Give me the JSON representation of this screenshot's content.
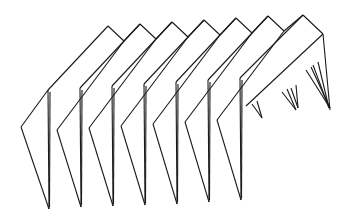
{
  "figure": {
    "stroke_color": "#1a1a1a",
    "background_color": "#ffffff",
    "pleat_count": 7,
    "left_vertex": [
      21,
      127
    ],
    "front_fold_tops": [
      [
        48,
        90
      ],
      [
        80,
        88
      ],
      [
        112,
        86
      ],
      [
        144,
        84
      ],
      [
        176,
        82
      ],
      [
        208,
        80
      ],
      [
        240,
        78
      ]
    ],
    "top_peaks": [
      [
        108,
        26
      ],
      [
        140,
        24
      ],
      [
        172,
        22
      ],
      [
        204,
        20
      ],
      [
        236,
        18
      ],
      [
        268,
        16
      ],
      [
        303,
        15
      ]
    ],
    "top_valleys": [
      [
        124,
        41
      ],
      [
        156,
        39
      ],
      [
        188,
        37
      ],
      [
        220,
        35
      ],
      [
        252,
        33
      ],
      [
        284,
        31
      ]
    ],
    "right_vertex": [
      323,
      34
    ],
    "bottom_tips": [
      [
        49,
        209
      ],
      [
        81,
        207
      ],
      [
        113,
        206
      ],
      [
        145,
        205
      ],
      [
        177,
        204
      ],
      [
        209,
        202
      ],
      [
        241,
        200
      ]
    ],
    "inner_ridge_points": [
      [
        57,
        130
      ],
      [
        89,
        128
      ],
      [
        121,
        126
      ],
      [
        153,
        124
      ],
      [
        185,
        122
      ],
      [
        217,
        120
      ]
    ],
    "back_spikes": [
      {
        "top": [
          252,
          104
        ],
        "tip": [
          262,
          118
        ]
      },
      {
        "top": [
          282,
          92
        ],
        "tip": [
          296,
          110
        ]
      },
      {
        "top": [
          291,
          88
        ],
        "tip": [
          298,
          108
        ]
      },
      {
        "top": [
          306,
          70
        ],
        "tip": [
          330,
          108
        ]
      },
      {
        "top": [
          313,
          65
        ],
        "tip": [
          329,
          108
        ]
      }
    ]
  }
}
